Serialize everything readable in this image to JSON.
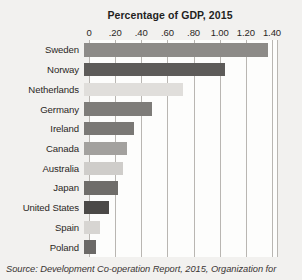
{
  "chart_data": {
    "type": "bar",
    "orientation": "horizontal",
    "title": "Percentage of GDP, 2015",
    "xlabel": "",
    "ylabel": "",
    "xlim": [
      0,
      1.45
    ],
    "grid": true,
    "legend": "none",
    "tick_labels": [
      "0",
      ".20",
      ".40",
      ".60",
      ".80",
      "1.00",
      "1.20",
      "1.40"
    ],
    "tick_values": [
      0,
      0.2,
      0.4,
      0.6,
      0.8,
      1.0,
      1.2,
      1.4
    ],
    "categories": [
      "Sweden",
      "Norway",
      "Netherlands",
      "Germany",
      "Ireland",
      "Canada",
      "Australia",
      "Japan",
      "United States",
      "Spain",
      "Poland"
    ],
    "values": [
      1.41,
      1.08,
      0.76,
      0.52,
      0.38,
      0.33,
      0.3,
      0.26,
      0.19,
      0.12,
      0.09
    ],
    "bar_colors": [
      "#8d8b88",
      "#5d5b59",
      "#e0dedb",
      "#7e7c79",
      "#7a7875",
      "#a3a19e",
      "#cfcdca",
      "#6f6d6a",
      "#4b4947",
      "#d7d5d2",
      "#6b6967"
    ]
  },
  "source": {
    "label": "Source:",
    "text": "Source: Development Co-operation Report, 2015, Organization for"
  }
}
